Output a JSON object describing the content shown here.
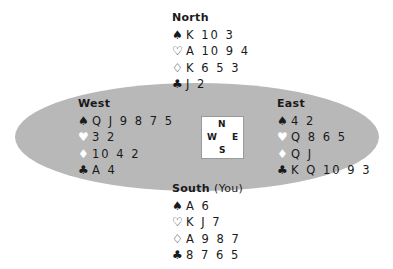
{
  "hands": {
    "north": {
      "label": "North",
      "sub": "",
      "spades": "K 10 3",
      "hearts": "A 10 9 4",
      "diamonds": "K 6 5 3",
      "clubs": "J 2"
    },
    "west": {
      "label": "West",
      "sub": "",
      "spades": "Q J 9 8 7 5",
      "hearts": "3 2",
      "diamonds": "10 4 2",
      "clubs": "A 4"
    },
    "east": {
      "label": "East",
      "sub": "",
      "spades": "4 2",
      "hearts": "Q 8 6 5",
      "diamonds": "Q J",
      "clubs": "K Q 10 9 3"
    },
    "south": {
      "label": "South",
      "sub": "(You)",
      "spades": "A 6",
      "hearts": "K J 7",
      "diamonds": "A 9 8 7",
      "clubs": "8 7 6 5"
    }
  },
  "suits": {
    "spades": "♠",
    "hearts_outline": "♡",
    "hearts_solid": "♥",
    "diamonds_outline": "♢",
    "diamonds_solid": "♦",
    "clubs": "♣"
  },
  "compass": {
    "n": "N",
    "s": "S",
    "e": "E",
    "w": "W"
  },
  "colors": {
    "table": "#b8b8b8",
    "text": "#1a1a1a"
  }
}
